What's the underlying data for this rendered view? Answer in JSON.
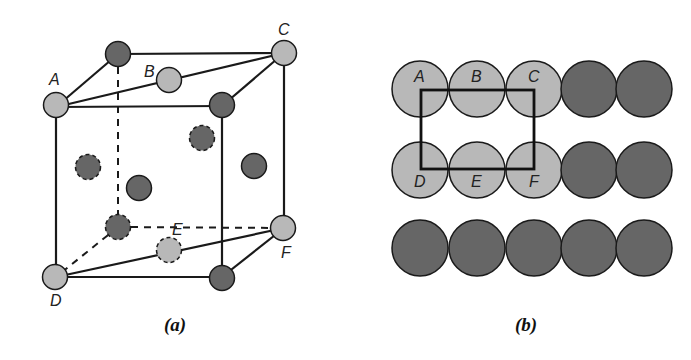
{
  "figure": {
    "panel_a": {
      "caption": "(a)",
      "labels": {
        "A": "A",
        "B": "B",
        "C": "C",
        "D": "D",
        "E": "E",
        "F": "F"
      }
    },
    "panel_b": {
      "caption": "(b)",
      "labels": {
        "A": "A",
        "B": "B",
        "C": "C",
        "D": "D",
        "E": "E",
        "F": "F"
      }
    },
    "colors": {
      "light_atom": "#b8b8b8",
      "dark_atom": "#666666",
      "outline": "#1a1a1a"
    }
  }
}
